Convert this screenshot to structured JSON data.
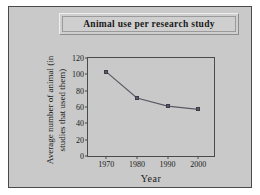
{
  "figure": {
    "background_color": "#c9c9c9",
    "border_color": "#4a4a4a",
    "title": "Animal use per research study"
  },
  "chart_data": {
    "type": "line",
    "title": "Animal use per research study",
    "xlabel": "Year",
    "ylabel": "Average number of animal (in studies that used them)",
    "categories": [
      "1970",
      "1980",
      "1990",
      "2000"
    ],
    "x": [
      1970,
      1980,
      1990,
      2000
    ],
    "values": [
      103,
      71,
      61,
      57
    ],
    "series": [
      {
        "name": "Average number of animals",
        "values": [
          103,
          71,
          61,
          57
        ]
      }
    ],
    "ylim": [
      0,
      120
    ],
    "yticks": [
      0,
      20,
      40,
      60,
      80,
      100,
      120
    ],
    "ytick_labels": [
      "0",
      "20",
      "40",
      "60",
      "80",
      "100",
      "120"
    ],
    "xtick_labels": [
      "1970",
      "1980",
      "1990",
      "2000"
    ],
    "grid": false,
    "legend": false,
    "line_color": "#5a5a66",
    "marker": "square",
    "marker_color": "#5a5a66"
  }
}
